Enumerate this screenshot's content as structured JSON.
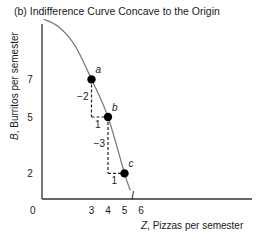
{
  "chart_data": {
    "type": "line",
    "title": "(b) Indifference Curve Concave to the Origin",
    "xlabel_var": "Z",
    "xlabel_text": ", Pizzas per semester",
    "ylabel_var": "B",
    "ylabel_text": ", Burritos per semester",
    "origin_label": "0",
    "x_ticks": [
      3,
      4,
      5,
      6
    ],
    "y_ticks": [
      7,
      5,
      2
    ],
    "curve_label": "I",
    "curve": [
      {
        "x": 0.1,
        "y": 10.2
      },
      {
        "x": 1.0,
        "y": 9.8
      },
      {
        "x": 2.0,
        "y": 8.8
      },
      {
        "x": 3.0,
        "y": 7.0
      },
      {
        "x": 4.0,
        "y": 5.0
      },
      {
        "x": 5.0,
        "y": 2.0
      },
      {
        "x": 5.35,
        "y": 1.1
      }
    ],
    "points": [
      {
        "label": "a",
        "x": 3,
        "y": 7
      },
      {
        "label": "b",
        "x": 4,
        "y": 5
      },
      {
        "label": "c",
        "x": 5,
        "y": 2
      }
    ],
    "steps": [
      {
        "from": "a",
        "to": "b",
        "dy_label": "−2",
        "dx_label": "1"
      },
      {
        "from": "b",
        "to": "c",
        "dy_label": "−3",
        "dx_label": "1"
      }
    ],
    "grid": false
  }
}
